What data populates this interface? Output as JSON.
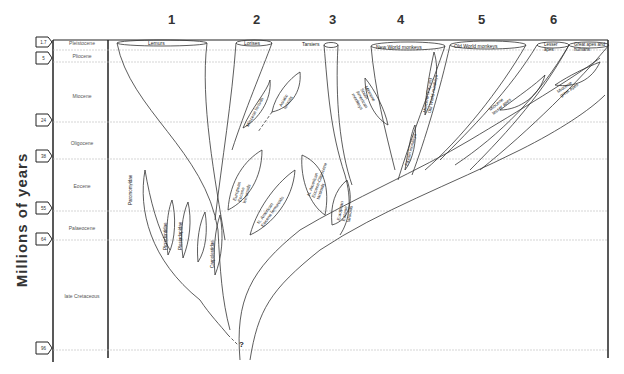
{
  "axis": {
    "label": "Millions of years"
  },
  "columns": [
    "1",
    "2",
    "3",
    "4",
    "5",
    "6"
  ],
  "epochs": [
    {
      "name": "Pleistocene",
      "top": 40
    },
    {
      "name": "Pliocene",
      "top": 53
    },
    {
      "name": "Miocene",
      "top": 93
    },
    {
      "name": "Oligocene",
      "top": 140
    },
    {
      "name": "Eocene",
      "top": 183
    },
    {
      "name": "Palaeocene",
      "top": 225
    },
    {
      "name": "late Cretaceous",
      "top": 293
    }
  ],
  "time_markers": [
    {
      "label": "1.7",
      "top": 40
    },
    {
      "label": "5",
      "top": 55
    },
    {
      "label": "24",
      "top": 117
    },
    {
      "label": "38",
      "top": 153
    },
    {
      "label": "55",
      "top": 205
    },
    {
      "label": "64",
      "top": 236
    },
    {
      "label": "96",
      "top": 345
    }
  ],
  "lineages": {
    "lemurs": "Lemurs",
    "lorises": "Lorises",
    "tarsiers": "Tarsiers",
    "new_world_monkeys": "New World monkeys",
    "old_world_monkeys": "Old World monkeys",
    "lesser_apes": "Lesser apes",
    "great_apes": "Great apes and humans"
  },
  "fossil_groups": {
    "paromomyidae": "Paromomyidae",
    "picrodontidae": "Picrodontidae",
    "plesiadapidae": "Plesiadapidae",
    "carpolestidae": "Carpolestidae",
    "miocene_lorisids": "Miocene lorisids",
    "asiatic_lorisids": "Asiatic lorisids",
    "european_eocene_lemuroids": "European Eocene lemuroids",
    "na_eocene_lemuroids": "N. American Eocene lemuroids",
    "na_eocene_oligocene_tarsioids": "N. American Eocene-Oligocene tarsioids",
    "european_eocene_tarsioids": "European Eocene tarsioids",
    "miocene_nw_monkeys": "Miocene South American monkeys",
    "miocene_ow_monkeys": "Miocene (Fayum) Old World monkeys",
    "fayum_monkeys": "Fayum monkeys",
    "miocene_lesser_apes": "Miocene lesser apes",
    "miocene_great_apes": "Miocene great apes"
  },
  "unknown_origin_mark": "?"
}
